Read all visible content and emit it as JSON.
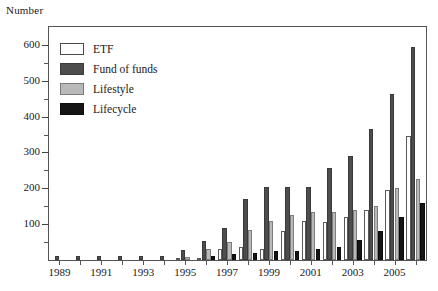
{
  "chart_data": {
    "type": "bar",
    "title": "",
    "ylabel": "Number",
    "xlabel": "",
    "ylim": [
      0,
      650
    ],
    "yticks": [
      100,
      200,
      300,
      400,
      500,
      600
    ],
    "grid": false,
    "legend_position": "top-left",
    "categories": [
      "1989",
      "1990",
      "1991",
      "1992",
      "1993",
      "1994",
      "1995",
      "1996",
      "1997",
      "1998",
      "1999",
      "2000",
      "2001",
      "2002",
      "2003",
      "2004",
      "2005",
      "2006"
    ],
    "xtick_labels": [
      "1989",
      "1991",
      "1993",
      "1995",
      "1997",
      "1999",
      "2001",
      "2003",
      "2005"
    ],
    "series": [
      {
        "name": "ETF",
        "color": "#fdfdfd",
        "values": [
          0,
          0,
          0,
          0,
          0,
          0,
          2,
          2,
          30,
          35,
          30,
          80,
          110,
          105,
          120,
          140,
          195,
          345
        ]
      },
      {
        "name": "Fund of funds",
        "color": "#4d4d4d",
        "values": [
          12,
          12,
          12,
          12,
          12,
          12,
          28,
          52,
          90,
          170,
          205,
          205,
          205,
          257,
          290,
          365,
          463,
          595
        ]
      },
      {
        "name": "Lifestyle",
        "color": "#b9b9b9",
        "values": [
          0,
          0,
          0,
          0,
          0,
          0,
          8,
          30,
          50,
          85,
          110,
          125,
          133,
          133,
          140,
          150,
          200,
          225
        ]
      },
      {
        "name": "Lifecycle",
        "color": "#151515",
        "values": [
          0,
          0,
          0,
          0,
          0,
          0,
          0,
          12,
          18,
          20,
          25,
          25,
          30,
          35,
          55,
          80,
          120,
          160
        ]
      }
    ]
  },
  "legend": {
    "items": [
      {
        "label": "ETF",
        "swatch": "etf"
      },
      {
        "label": "Fund of funds",
        "swatch": "fof"
      },
      {
        "label": "Lifestyle",
        "swatch": "lifestyle"
      },
      {
        "label": "Lifecycle",
        "swatch": "lifecycle"
      }
    ]
  }
}
